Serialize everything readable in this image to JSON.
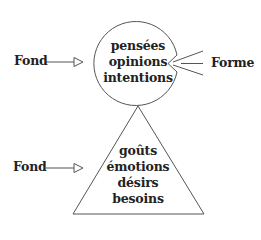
{
  "diagram": {
    "top_shape": {
      "shape": "circle",
      "items": [
        "pensées",
        "opinions",
        "intentions"
      ]
    },
    "bottom_shape": {
      "shape": "triangle",
      "items": [
        "goûts",
        "émotions",
        "désirs",
        "besoins"
      ]
    },
    "labels": {
      "fond_top": "Fond",
      "fond_bottom": "Fond",
      "forme": "Forme"
    },
    "colors": {
      "stroke": "#555555",
      "text": "#222222",
      "background": "#ffffff"
    }
  }
}
